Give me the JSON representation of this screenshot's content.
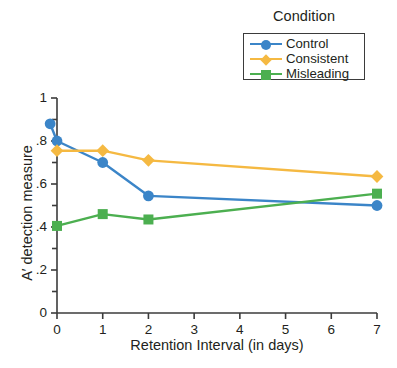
{
  "legend": {
    "title": "Condition",
    "entries": [
      {
        "label": "Control",
        "color": "#3b85c8",
        "marker": "circle"
      },
      {
        "label": "Consistent",
        "color": "#f5b942",
        "marker": "diamond"
      },
      {
        "label": "Misleading",
        "color": "#4caf50",
        "marker": "square"
      }
    ]
  },
  "chart_data": {
    "type": "line",
    "title": "",
    "xlabel": "Retention Interval (in days)",
    "ylabel": "A′ detection measure",
    "xlim": [
      0,
      7
    ],
    "ylim": [
      0,
      1
    ],
    "xticks": [
      0,
      1,
      2,
      3,
      4,
      5,
      6,
      7
    ],
    "xticklabels": [
      "0",
      "1",
      "2",
      "3",
      "4",
      "5",
      "6",
      "7"
    ],
    "yticks": [
      0,
      0.2,
      0.4,
      0.6,
      0.8,
      1
    ],
    "yticklabels": [
      "0",
      ".2",
      ".4",
      ".6",
      ".8",
      "1"
    ],
    "grid": false,
    "legend_position": "top-right",
    "series": [
      {
        "name": "Control",
        "color": "#3b85c8",
        "marker": "circle",
        "x": [
          -0.15,
          0,
          1,
          2,
          7
        ],
        "y": [
          0.88,
          0.8,
          0.7,
          0.545,
          0.5
        ]
      },
      {
        "name": "Consistent",
        "color": "#f5b942",
        "marker": "diamond",
        "x": [
          0,
          1,
          2,
          7
        ],
        "y": [
          0.755,
          0.755,
          0.71,
          0.635
        ]
      },
      {
        "name": "Misleading",
        "color": "#4caf50",
        "marker": "square",
        "x": [
          0,
          1,
          2,
          7
        ],
        "y": [
          0.405,
          0.46,
          0.435,
          0.555
        ]
      }
    ]
  }
}
